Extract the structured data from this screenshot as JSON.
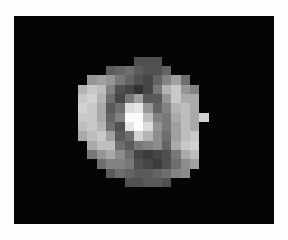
{
  "image": {
    "description": "Pixelated grayscale image of a ring-shaped bright object with a bright core on a black background",
    "background": "#050505",
    "border_color": "#fdfdfd",
    "grid": {
      "cols": 15,
      "rows": 16,
      "cell": 9.33,
      "values": [
        [
          0,
          0,
          0,
          0,
          0,
          0,
          0,
          0,
          0,
          0,
          0,
          0,
          0,
          0,
          0
        ],
        [
          0,
          0,
          0,
          0,
          0,
          0,
          0,
          0,
          0,
          0,
          0,
          0,
          0,
          0,
          0
        ],
        [
          0,
          0,
          0,
          0,
          0,
          0,
          80,
          80,
          80,
          0,
          0,
          0,
          0,
          0,
          0
        ],
        [
          0,
          0,
          0,
          90,
          100,
          110,
          90,
          80,
          80,
          100,
          0,
          0,
          0,
          0,
          0
        ],
        [
          0,
          150,
          160,
          150,
          120,
          100,
          80,
          70,
          100,
          130,
          160,
          110,
          0,
          0,
          0
        ],
        [
          180,
          200,
          190,
          130,
          80,
          70,
          50,
          70,
          120,
          180,
          200,
          150,
          130,
          0,
          0
        ],
        [
          200,
          210,
          180,
          110,
          70,
          120,
          160,
          90,
          90,
          150,
          200,
          170,
          170,
          0,
          0
        ],
        [
          210,
          200,
          170,
          90,
          110,
          220,
          230,
          150,
          100,
          130,
          180,
          190,
          170,
          0,
          0
        ],
        [
          200,
          200,
          170,
          100,
          130,
          250,
          250,
          190,
          130,
          120,
          170,
          190,
          170,
          210,
          0
        ],
        [
          190,
          200,
          180,
          110,
          80,
          230,
          255,
          220,
          150,
          120,
          160,
          190,
          170,
          0,
          0
        ],
        [
          170,
          190,
          200,
          160,
          90,
          110,
          210,
          180,
          140,
          110,
          160,
          190,
          200,
          0,
          0
        ],
        [
          0,
          170,
          190,
          190,
          110,
          90,
          120,
          130,
          140,
          100,
          170,
          200,
          210,
          0,
          0
        ],
        [
          0,
          120,
          150,
          170,
          140,
          110,
          70,
          60,
          70,
          80,
          120,
          170,
          190,
          0,
          0
        ],
        [
          0,
          0,
          110,
          130,
          130,
          120,
          80,
          70,
          60,
          80,
          110,
          140,
          160,
          0,
          0
        ],
        [
          0,
          0,
          0,
          90,
          110,
          100,
          90,
          90,
          100,
          110,
          130,
          140,
          0,
          0,
          0
        ],
        [
          0,
          0,
          0,
          0,
          0,
          80,
          80,
          90,
          90,
          80,
          0,
          0,
          0,
          0,
          0
        ]
      ]
    }
  }
}
